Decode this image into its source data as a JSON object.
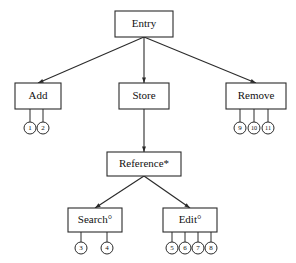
{
  "diagram": {
    "type": "tree",
    "title": "",
    "background_color": "#ffffff",
    "line_color": "#2b2b2b",
    "text_color": "#111111",
    "nodes": [
      {
        "id": "entry",
        "label": "Entry",
        "x": 144,
        "y": 24,
        "w": 58,
        "h": 26,
        "level": 0
      },
      {
        "id": "add",
        "label": "Add",
        "x": 38,
        "y": 96,
        "w": 46,
        "h": 26,
        "level": 1
      },
      {
        "id": "store",
        "label": "Store",
        "x": 144,
        "y": 96,
        "w": 50,
        "h": 26,
        "level": 1
      },
      {
        "id": "remove",
        "label": "Remove",
        "x": 256,
        "y": 96,
        "w": 60,
        "h": 26,
        "level": 1
      },
      {
        "id": "reference",
        "label": "Reference*",
        "x": 144,
        "y": 164,
        "w": 74,
        "h": 24,
        "level": 2
      },
      {
        "id": "search",
        "label": "Search°",
        "x": 95,
        "y": 220,
        "w": 54,
        "h": 24,
        "level": 3
      },
      {
        "id": "edit",
        "label": "Edit°",
        "x": 190,
        "y": 220,
        "w": 54,
        "h": 24,
        "level": 3
      }
    ],
    "edges": [
      {
        "from": "entry",
        "to": "add",
        "arrow": true
      },
      {
        "from": "entry",
        "to": "store",
        "arrow": true
      },
      {
        "from": "entry",
        "to": "remove",
        "arrow": true
      },
      {
        "from": "store",
        "to": "reference",
        "arrow": true
      },
      {
        "from": "reference",
        "to": "search",
        "arrow": true
      },
      {
        "from": "reference",
        "to": "edit",
        "arrow": true
      }
    ],
    "leaves": [
      {
        "parent": "add",
        "label": "1",
        "cx": 30,
        "cy": 128,
        "r": 6
      },
      {
        "parent": "add",
        "label": "2",
        "cx": 43,
        "cy": 128,
        "r": 6
      },
      {
        "parent": "remove",
        "label": "9",
        "cx": 240,
        "cy": 128,
        "r": 6
      },
      {
        "parent": "remove",
        "label": "10",
        "cx": 254,
        "cy": 128,
        "r": 6
      },
      {
        "parent": "remove",
        "label": "11",
        "cx": 268,
        "cy": 128,
        "r": 6
      },
      {
        "parent": "search",
        "label": "3",
        "cx": 81,
        "cy": 248,
        "r": 6
      },
      {
        "parent": "search",
        "label": "4",
        "cx": 107,
        "cy": 248,
        "r": 6
      },
      {
        "parent": "edit",
        "label": "5",
        "cx": 172,
        "cy": 248,
        "r": 6
      },
      {
        "parent": "edit",
        "label": "6",
        "cx": 185,
        "cy": 248,
        "r": 6
      },
      {
        "parent": "edit",
        "label": "7",
        "cx": 198,
        "cy": 248,
        "r": 6
      },
      {
        "parent": "edit",
        "label": "8",
        "cx": 211,
        "cy": 248,
        "r": 6
      }
    ]
  }
}
